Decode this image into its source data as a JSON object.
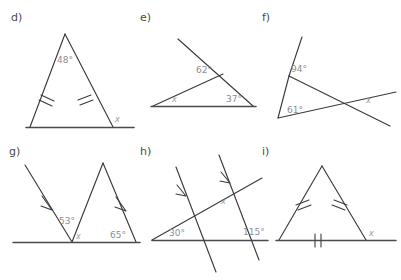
{
  "page": {
    "background_color": "#ffffff",
    "line_color": "#3b3b3f",
    "label_color": "#4a4a4a",
    "angle_label_color": "#8d8d93"
  },
  "figures": [
    {
      "id": "d",
      "label": "d)",
      "description": "isosceles triangle with apex angle and exterior angle",
      "angles": [
        {
          "name": "apex",
          "text": "48°"
        },
        {
          "name": "exterior",
          "text": "x"
        }
      ],
      "marks": "two single tick marks on the congruent legs"
    },
    {
      "id": "e",
      "label": "e)",
      "description": "triangle with one side extended beyond a vertex",
      "angles": [
        {
          "name": "upper-left",
          "text": "62°"
        },
        {
          "name": "right",
          "text": "37°"
        },
        {
          "name": "left",
          "text": "x"
        }
      ],
      "marks": "none"
    },
    {
      "id": "f",
      "label": "f)",
      "description": "two crossing lines forming vertically opposite angles with a triangle",
      "angles": [
        {
          "name": "upper",
          "text": "94°"
        },
        {
          "name": "lower-left",
          "text": "61°"
        },
        {
          "name": "crossing",
          "text": "x"
        }
      ],
      "marks": "none"
    },
    {
      "id": "g",
      "label": "g)",
      "description": "zigzag of two parallel segments meeting a straight base line",
      "angles": [
        {
          "name": "left",
          "text": "53°"
        },
        {
          "name": "middle",
          "text": "x"
        },
        {
          "name": "right",
          "text": "65°"
        }
      ],
      "marks": "single arrow marks on the two parallel segments"
    },
    {
      "id": "h",
      "label": "h)",
      "description": "two parallel transversals crossing two lines",
      "angles": [
        {
          "name": "left",
          "text": "30°"
        },
        {
          "name": "upper-right",
          "text": "x"
        },
        {
          "name": "lower-right",
          "text": "115°"
        }
      ],
      "marks": "single arrow marks on the two parallel lines"
    },
    {
      "id": "i",
      "label": "i)",
      "description": "equilateral triangle with base extended and exterior angle",
      "angles": [
        {
          "name": "exterior",
          "text": "x"
        }
      ],
      "marks": "single ticks on the two legs and a double tick on the base"
    }
  ]
}
